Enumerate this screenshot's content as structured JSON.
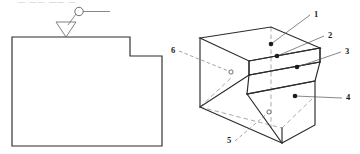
{
  "page": {
    "header_fragment": "— —— —— —"
  },
  "orthographic_view": {
    "name": "front-view-outline",
    "description": "Stepped L-shaped profile outline",
    "surface_symbol": {
      "name": "surface-finish-symbol",
      "circle_label": "",
      "tail_label": ""
    }
  },
  "isometric_view": {
    "name": "isometric-stepped-block",
    "description": "Pictorial view of stepped block with numbered surfaces",
    "labels": [
      {
        "id": "1",
        "text": "1",
        "x": 316,
        "y": 14,
        "target_x": 271,
        "target_y": 44,
        "marker": "dot",
        "style": "solid"
      },
      {
        "id": "2",
        "text": "2",
        "x": 330,
        "y": 35,
        "target_x": 277,
        "target_y": 56,
        "marker": "dot",
        "style": "solid"
      },
      {
        "id": "3",
        "text": "3",
        "x": 347,
        "y": 51,
        "target_x": 297,
        "target_y": 67,
        "marker": "dot",
        "style": "solid"
      },
      {
        "id": "4",
        "text": "4",
        "x": 348,
        "y": 97,
        "target_x": 295,
        "target_y": 96,
        "marker": "dot",
        "style": "solid"
      },
      {
        "id": "5",
        "text": "5",
        "x": 229,
        "y": 140,
        "target_x": 269,
        "target_y": 112,
        "marker": "ring",
        "style": "dashed"
      },
      {
        "id": "6",
        "text": "6",
        "x": 173,
        "y": 50,
        "target_x": 231,
        "target_y": 72,
        "marker": "ring",
        "style": "dashed"
      }
    ]
  },
  "colors": {
    "line": "#2b2b2b",
    "hidden_line": "#8d8d8d",
    "leader": "#555555",
    "label": "#1a1a1a",
    "background": "#ffffff"
  }
}
